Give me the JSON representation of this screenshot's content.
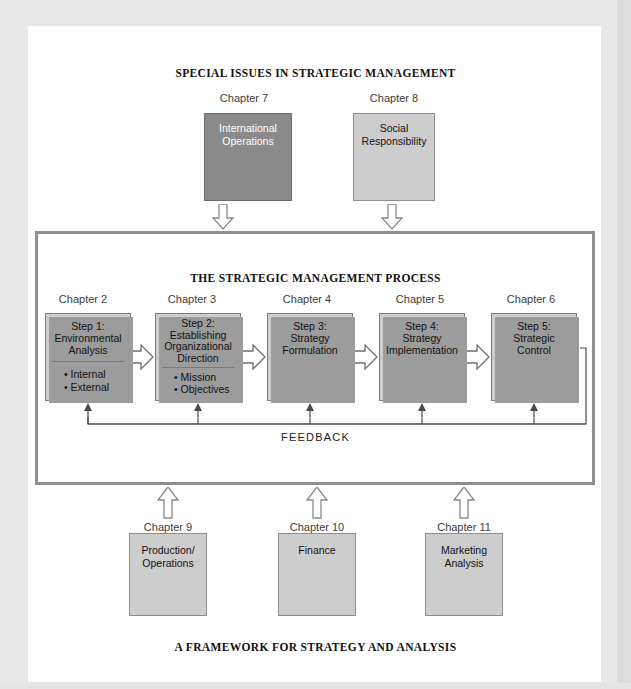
{
  "diagram": {
    "top_heading": "SPECIAL ISSUES IN STRATEGIC MANAGEMENT",
    "process_heading": "THE STRATEGIC MANAGEMENT PROCESS",
    "bottom_heading": "A FRAMEWORK FOR STRATEGY AND ANALYSIS",
    "feedback_label": "FEEDBACK"
  },
  "special_issues": [
    {
      "chapter": "Chapter 7",
      "label": "International\nOperations",
      "line1": "International",
      "line2": "Operations",
      "fill": "#8a8a8a",
      "text_color": "#ffffff",
      "shadow": "#111111"
    },
    {
      "chapter": "Chapter 8",
      "label": "Social\nResponsibility",
      "line1": "Social",
      "line2": "Responsibility",
      "fill": "#cdcdcd",
      "text_color": "#111111",
      "shadow": "#9c9c9c"
    }
  ],
  "process_steps": [
    {
      "chapter": "Chapter 2",
      "title_line1": "Step 1:",
      "title_line2": "Environmental",
      "title_line3": "Analysis",
      "bullets": [
        "• Internal",
        "• External"
      ]
    },
    {
      "chapter": "Chapter 3",
      "title_line1": "Step 2:",
      "title_line2": "Establishing",
      "title_line3": "Organizational",
      "title_line4": "Direction",
      "bullets": [
        "• Mission",
        "• Objectives"
      ]
    },
    {
      "chapter": "Chapter 4",
      "title_line1": "Step 3:",
      "title_line2": "Strategy",
      "title_line3": "Formulation",
      "bullets": []
    },
    {
      "chapter": "Chapter 5",
      "title_line1": "Step 4:",
      "title_line2": "Strategy",
      "title_line3": "Implementation",
      "bullets": []
    },
    {
      "chapter": "Chapter 6",
      "title_line1": "Step 5:",
      "title_line2": "Strategic",
      "title_line3": "Control",
      "bullets": []
    }
  ],
  "support_areas": [
    {
      "chapter": "Chapter 9",
      "line1": "Production/",
      "line2": "Operations"
    },
    {
      "chapter": "Chapter 10",
      "line1": "Finance",
      "line2": ""
    },
    {
      "chapter": "Chapter 11",
      "line1": "Marketing",
      "line2": "Analysis"
    }
  ],
  "colors": {
    "box_fill": "#cdcdcd",
    "box_border": "#8d8d8d",
    "dark_box_fill": "#8a8a8a",
    "shadow_gray": "#9c9c9c",
    "frame_border": "#8f8f8f",
    "page_edge": "#e8e8e8"
  }
}
